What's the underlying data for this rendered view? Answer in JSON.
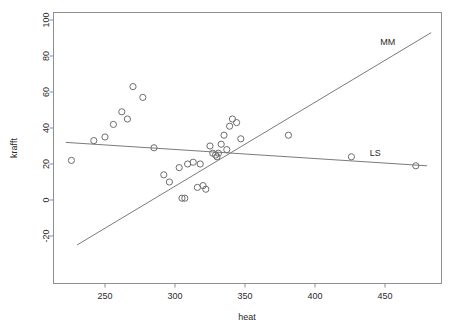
{
  "chart_data": {
    "type": "scatter",
    "title": "",
    "xlabel": "heat",
    "ylabel": "krafft",
    "xlim": [
      218,
      481
    ],
    "ylim": [
      -28,
      105
    ],
    "xticks": [
      250,
      300,
      350,
      400,
      450
    ],
    "yticks": [
      -20,
      0,
      20,
      40,
      60,
      80,
      100
    ],
    "xtick_labels": [
      "250",
      "300",
      "350",
      "400",
      "450"
    ],
    "ytick_labels": [
      "-20",
      "0",
      "20",
      "40",
      "60",
      "80",
      "100"
    ],
    "grid": false,
    "legend": "none",
    "point_marker": "open-circle",
    "points": [
      {
        "x": 226,
        "y": 22
      },
      {
        "x": 242,
        "y": 33
      },
      {
        "x": 250,
        "y": 35
      },
      {
        "x": 256,
        "y": 42
      },
      {
        "x": 262,
        "y": 49
      },
      {
        "x": 266,
        "y": 45
      },
      {
        "x": 270,
        "y": 63
      },
      {
        "x": 277,
        "y": 57
      },
      {
        "x": 285,
        "y": 29
      },
      {
        "x": 292,
        "y": 14
      },
      {
        "x": 296,
        "y": 10
      },
      {
        "x": 303,
        "y": 18
      },
      {
        "x": 305,
        "y": 1
      },
      {
        "x": 307,
        "y": 1
      },
      {
        "x": 309,
        "y": 20
      },
      {
        "x": 313,
        "y": 21
      },
      {
        "x": 316,
        "y": 7
      },
      {
        "x": 318,
        "y": 20
      },
      {
        "x": 320,
        "y": 8
      },
      {
        "x": 322,
        "y": 6
      },
      {
        "x": 325,
        "y": 30
      },
      {
        "x": 327,
        "y": 26
      },
      {
        "x": 329,
        "y": 25
      },
      {
        "x": 330,
        "y": 24
      },
      {
        "x": 331,
        "y": 26
      },
      {
        "x": 333,
        "y": 31
      },
      {
        "x": 335,
        "y": 36
      },
      {
        "x": 337,
        "y": 28
      },
      {
        "x": 339,
        "y": 41
      },
      {
        "x": 341,
        "y": 45
      },
      {
        "x": 344,
        "y": 43
      },
      {
        "x": 347,
        "y": 34
      },
      {
        "x": 381,
        "y": 36
      },
      {
        "x": 426,
        "y": 24
      },
      {
        "x": 472,
        "y": 19
      }
    ],
    "fit_lines": [
      {
        "name": "MM",
        "label": "MM",
        "label_x": 452,
        "label_y": 88,
        "x_start": 230,
        "y_start": -25,
        "x_end": 483,
        "y_end": 93
      },
      {
        "name": "LS",
        "label": "LS",
        "label_x": 443,
        "label_y": 26,
        "x_start": 222,
        "y_start": 32,
        "x_end": 480,
        "y_end": 19
      }
    ],
    "colors": {
      "frame": "#8f8f8f",
      "point": "#6e6e6e",
      "line": "#7b7b7b",
      "text": "#2b2b2b",
      "background": "#ffffff"
    }
  }
}
